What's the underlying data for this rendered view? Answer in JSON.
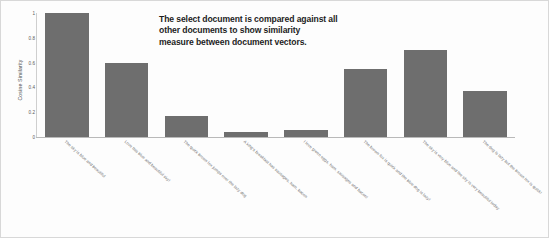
{
  "chart_data": {
    "type": "bar",
    "title": "",
    "xlabel": "",
    "ylabel": "Cosine Similarity",
    "ylim": [
      0,
      1
    ],
    "ytick_labels": [
      "0",
      "0.2",
      "0.4",
      "0.6",
      "0.8",
      "1"
    ],
    "ytick_values": [
      0,
      0.2,
      0.4,
      0.6,
      0.8,
      1
    ],
    "grid": false,
    "legend": null,
    "bar_color": "#6e6e6e",
    "categories": [
      "The sky is blue and beautiful",
      "Love this blue and beautiful sky!",
      "The quick brown fox jumps over the lazy dog",
      "A king's breakfast has sausages, ham, bacon",
      "I love green eggs, ham, sausages and bacon!",
      "The brown fox is quick and the blue dog is lazy!",
      "The sky is very blue and the sky is very beautiful today",
      "The dog is lazy but the brown fox is quick!"
    ],
    "values": [
      1.0,
      0.6,
      0.17,
      0.04,
      0.06,
      0.55,
      0.7,
      0.37
    ],
    "annotations": [
      "The select document is compared against all",
      "other documents to show similarity",
      "measure between document vectors."
    ]
  }
}
